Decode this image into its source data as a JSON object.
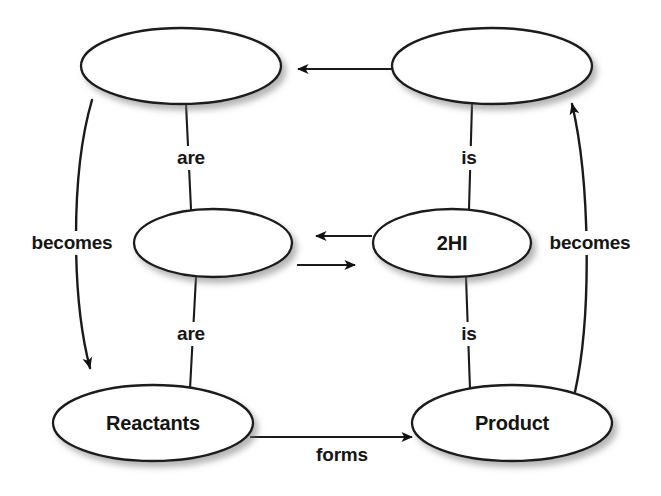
{
  "diagram": {
    "type": "concept-map",
    "title": "",
    "background_color": "#ffffff",
    "stroke_color": "#1a1a1a",
    "text_color": "#141414",
    "nodes": [
      {
        "id": "top-left",
        "label": "",
        "cx": 181,
        "cy": 66,
        "rx": 100,
        "ry": 38
      },
      {
        "id": "top-right",
        "label": "",
        "cx": 492,
        "cy": 66,
        "rx": 100,
        "ry": 38
      },
      {
        "id": "middle-left",
        "label": "",
        "cx": 213,
        "cy": 243,
        "rx": 79,
        "ry": 34
      },
      {
        "id": "middle-right",
        "label": "2HI",
        "cx": 452,
        "cy": 243,
        "rx": 79,
        "ry": 34
      },
      {
        "id": "bottom-left",
        "label": "Reactants",
        "cx": 153,
        "cy": 423,
        "rx": 100,
        "ry": 38
      },
      {
        "id": "bottom-right",
        "label": "Product",
        "cx": 512,
        "cy": 423,
        "rx": 100,
        "ry": 38
      }
    ],
    "edges": [
      {
        "id": "top-left-are",
        "label": "are",
        "from": "top-left",
        "to": "middle-left",
        "style": "plain-line",
        "label_x": 191,
        "label_y": 158
      },
      {
        "id": "top-right-is",
        "label": "is",
        "from": "top-right",
        "to": "middle-right",
        "style": "plain-line",
        "label_x": 469,
        "label_y": 158
      },
      {
        "id": "bottom-left-are",
        "label": "are",
        "from": "middle-left",
        "to": "bottom-left",
        "style": "plain-line",
        "label_x": 191,
        "label_y": 334
      },
      {
        "id": "bottom-right-is",
        "label": "is",
        "from": "middle-right",
        "to": "bottom-right",
        "style": "plain-line",
        "label_x": 469,
        "label_y": 334
      },
      {
        "id": "left-becomes",
        "label": "becomes",
        "from": "top-left",
        "to": "bottom-left",
        "style": "curved-arrow",
        "label_x": 72,
        "label_y": 243
      },
      {
        "id": "right-becomes",
        "label": "becomes",
        "from": "bottom-right",
        "to": "top-right",
        "style": "curved-arrow",
        "label_x": 590,
        "label_y": 243
      },
      {
        "id": "forms",
        "label": "forms",
        "from": "bottom-left",
        "to": "bottom-right",
        "style": "straight-arrow",
        "label_x": 342,
        "label_y": 455
      },
      {
        "id": "top-arrow",
        "label": "",
        "from": "top-right",
        "to": "top-left",
        "style": "straight-arrow"
      },
      {
        "id": "equilibrium-reverse",
        "label": "",
        "from": "middle-right",
        "to": "middle-left",
        "style": "straight-arrow"
      },
      {
        "id": "equilibrium-forward",
        "label": "",
        "from": "middle-left",
        "to": "middle-right",
        "style": "straight-arrow"
      }
    ]
  }
}
